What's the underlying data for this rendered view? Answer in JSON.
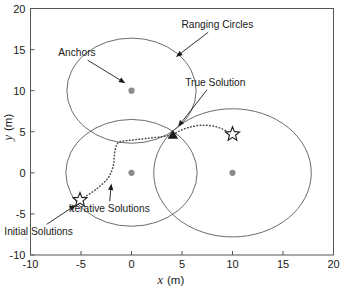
{
  "chart_data": {
    "type": "scatter",
    "title": "",
    "xlabel": "x (m)",
    "ylabel": "y (m)",
    "xlim": [
      -10,
      20
    ],
    "ylim": [
      -10,
      20
    ],
    "xticks": [
      -10,
      -5,
      0,
      5,
      10,
      15,
      20
    ],
    "xtick_labels": [
      "-10",
      "-5",
      "0",
      "5",
      "10",
      "15",
      "20"
    ],
    "yticks": [
      -10,
      -5,
      0,
      5,
      10,
      15,
      20
    ],
    "ytick_labels": [
      "-10",
      "-5",
      "0",
      "5",
      "10",
      "15",
      "20"
    ],
    "grid": false,
    "legend": "none",
    "xlabel_var": "x",
    "xlabel_unit": "(m)",
    "ylabel_var": "y",
    "ylabel_unit": "(m)",
    "series": [
      {
        "name": "Anchors",
        "marker": "filled-circle",
        "color": "#8a8a8a",
        "points": [
          {
            "x": 0,
            "y": 10
          },
          {
            "x": 0,
            "y": 0
          },
          {
            "x": 10,
            "y": 0
          }
        ]
      },
      {
        "name": "Ranging Circles",
        "marker": "circle-outline",
        "color": "#5a5a5a",
        "circles": [
          {
            "cx": 0,
            "cy": 10,
            "r": 6.4
          },
          {
            "cx": 0,
            "cy": 0,
            "r": 6.5
          },
          {
            "cx": 10,
            "cy": 0,
            "r": 7.8
          }
        ]
      },
      {
        "name": "True Solution",
        "marker": "filled-triangle",
        "color": "#1a1a1a",
        "points": [
          {
            "x": 4.1,
            "y": 4.6
          }
        ]
      },
      {
        "name": "Initial Solutions",
        "marker": "open-star",
        "color": "#1a1a1a",
        "points": [
          {
            "x": 10.0,
            "y": 4.7
          },
          {
            "x": -5.1,
            "y": -3.3
          }
        ]
      },
      {
        "name": "Iterative Solutions",
        "marker": "dotted-path",
        "color": "#4a4a4a",
        "paths": [
          {
            "from": "Initial Solution (10.0, 4.7)",
            "to": "True Solution (4.1, 4.6)",
            "points": [
              {
                "x": 9.6,
                "y": 5.0
              },
              {
                "x": 8.4,
                "y": 5.6
              },
              {
                "x": 7.0,
                "y": 5.8
              },
              {
                "x": 5.6,
                "y": 5.5
              },
              {
                "x": 4.6,
                "y": 5.0
              },
              {
                "x": 4.1,
                "y": 4.6
              }
            ]
          },
          {
            "from": "Initial Solution (-5.1, -3.3)",
            "to": "True Solution (4.1, 4.6)",
            "points": [
              {
                "x": -4.7,
                "y": -3.0
              },
              {
                "x": -3.4,
                "y": -1.9
              },
              {
                "x": -2.3,
                "y": -0.6
              },
              {
                "x": -1.8,
                "y": 0.9
              },
              {
                "x": -1.7,
                "y": 2.2
              },
              {
                "x": -1.5,
                "y": 3.3
              },
              {
                "x": -1.1,
                "y": 3.8
              },
              {
                "x": 0.2,
                "y": 4.0
              },
              {
                "x": 1.6,
                "y": 4.2
              },
              {
                "x": 3.0,
                "y": 4.4
              },
              {
                "x": 4.1,
                "y": 4.6
              }
            ]
          }
        ]
      }
    ],
    "annotations": [
      {
        "id": "ranging-circles",
        "text": "Ranging Circles",
        "text_x": 8.5,
        "text_y": 17.6,
        "target_x": 4.4,
        "target_y": 14.1
      },
      {
        "id": "anchors",
        "text": "Anchors",
        "text_x": -5.4,
        "text_y": 14.2,
        "target_x": -0.6,
        "target_y": 10.9
      },
      {
        "id": "true-solution",
        "text": "True Solution",
        "text_x": 8.3,
        "text_y": 10.6,
        "target_x": 4.6,
        "target_y": 5.6
      },
      {
        "id": "iterative-solutions",
        "text": "Iterative Solutions",
        "text_x": -2.2,
        "text_y": -4.8,
        "target_x": -2.0,
        "target_y": -1.3
      },
      {
        "id": "initial-solutions",
        "text": "Initial Solutions",
        "text_x": -9.2,
        "text_y": -7.6,
        "target_x": -5.5,
        "target_y": -3.9
      }
    ]
  },
  "colors": {
    "anchor": "#8a8a8a",
    "circle": "#5a5a5a",
    "marker": "#1a1a1a",
    "path": "#4a4a4a",
    "axis": "#555555",
    "background": "#ffffff"
  }
}
